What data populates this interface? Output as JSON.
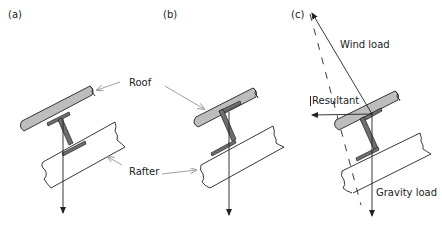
{
  "figure": {
    "panels": [
      {
        "id": "a",
        "label": "(a)",
        "section": "I-section"
      },
      {
        "id": "b",
        "label": "(b)",
        "section": "Z-section"
      },
      {
        "id": "c",
        "label": "(c)",
        "section": "Z-section"
      }
    ],
    "labels": {
      "roof": "Roof",
      "rafter": "Rafter",
      "wind_load": "Wind load",
      "resultant": "Resultant",
      "gravity_load": "Gravity load"
    },
    "colors": {
      "roof_fill": "#bdbdbd",
      "purlin_fill": "#6e6e6e",
      "line": "#222222",
      "leader": "#888888"
    }
  }
}
